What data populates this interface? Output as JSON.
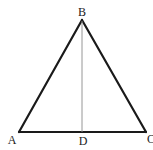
{
  "diagram": {
    "type": "geometry",
    "shape": "triangle",
    "colors": {
      "side": "#1a1a1a",
      "altitude": "#8a8a8a",
      "label": "#222222",
      "background": "#ffffff"
    },
    "points": {
      "A": {
        "x": 19,
        "y": 132
      },
      "B": {
        "x": 82,
        "y": 20
      },
      "C": {
        "x": 146,
        "y": 132
      },
      "D": {
        "x": 82,
        "y": 132
      }
    },
    "labels": {
      "A": "A",
      "B": "B",
      "C": "C",
      "D": "D"
    },
    "segments": [
      {
        "from": "A",
        "to": "B",
        "kind": "side"
      },
      {
        "from": "B",
        "to": "C",
        "kind": "side"
      },
      {
        "from": "A",
        "to": "C",
        "kind": "side"
      },
      {
        "from": "B",
        "to": "D",
        "kind": "altitude"
      }
    ]
  }
}
